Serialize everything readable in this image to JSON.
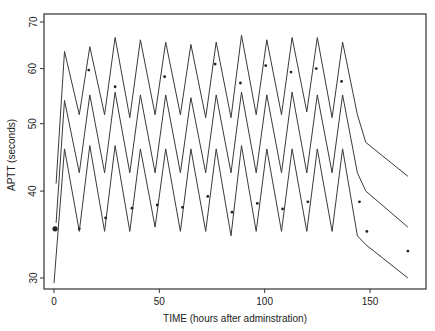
{
  "chart_data": {
    "type": "line",
    "title": "",
    "xlabel": "TIME (hours after adminstration)",
    "ylabel": "APTT (seconds)",
    "yscale": "log",
    "xlim": [
      -6,
      176
    ],
    "ylim": [
      29,
      72
    ],
    "xticks": [
      0,
      50,
      100,
      150
    ],
    "yticks": [
      30,
      40,
      50,
      60,
      70
    ],
    "grid": false,
    "legend": null,
    "series": [
      {
        "name": "upper prediction band",
        "style": "line",
        "x": [
          1,
          5,
          12,
          17,
          24,
          29,
          36,
          41,
          48,
          53,
          60,
          65,
          72,
          77,
          84,
          89,
          96,
          101,
          108,
          113,
          120,
          125,
          132,
          137,
          144,
          148,
          168
        ],
        "y": [
          41,
          63.5,
          51.5,
          64.5,
          51.5,
          66.5,
          51,
          66,
          51.5,
          65.5,
          51.5,
          65,
          51,
          65.5,
          51,
          67,
          51.5,
          66,
          51.5,
          66.5,
          52,
          66.5,
          51,
          65.5,
          51.5,
          47,
          42
        ]
      },
      {
        "name": "median prediction",
        "style": "line",
        "x": [
          1,
          5,
          12,
          17,
          24,
          29,
          36,
          41,
          48,
          53,
          60,
          65,
          72,
          77,
          84,
          89,
          96,
          101,
          108,
          113,
          120,
          125,
          132,
          137,
          144,
          148,
          168
        ],
        "y": [
          36,
          54,
          42.5,
          55,
          42.5,
          55.5,
          42.5,
          55,
          42.5,
          55,
          42.5,
          54.5,
          42.5,
          55,
          42.5,
          55.5,
          42.5,
          55,
          42.5,
          55.5,
          42.5,
          55,
          42.5,
          55,
          42.5,
          40,
          35.5
        ]
      },
      {
        "name": "lower prediction band",
        "style": "line",
        "x": [
          0,
          5,
          12,
          17,
          24,
          29,
          36,
          41,
          48,
          53,
          60,
          65,
          72,
          77,
          84,
          89,
          96,
          101,
          108,
          113,
          120,
          125,
          132,
          137,
          144,
          148,
          168
        ],
        "y": [
          29.5,
          46,
          35,
          46.5,
          35,
          46.5,
          35,
          46,
          35.5,
          46,
          35,
          46,
          35,
          46,
          34.5,
          46.5,
          35,
          46,
          35,
          46,
          35,
          46,
          35,
          46,
          34.5,
          33.5,
          30
        ]
      },
      {
        "name": "observed",
        "style": "points",
        "x": [
          0.5,
          12,
          16.5,
          24.5,
          29,
          37,
          49,
          52.5,
          61,
          73,
          76.5,
          84.5,
          88.5,
          96.5,
          100.5,
          108.5,
          112.5,
          120.5,
          124.5,
          136.5,
          145,
          148.5,
          168
        ],
        "y": [
          35.3,
          35.3,
          59.7,
          36.6,
          56.5,
          37.8,
          38.2,
          58.4,
          37.9,
          39.3,
          60.9,
          37.3,
          57.2,
          38.4,
          60.6,
          37.7,
          59.3,
          38.6,
          60.0,
          57.5,
          38.6,
          35.0,
          32.8
        ]
      }
    ]
  }
}
